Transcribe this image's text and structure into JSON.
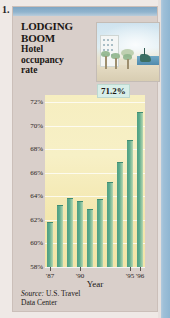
{
  "item_number": "1.",
  "headline": {
    "line1": "LODGING",
    "line2": "BOOM",
    "sub1": "Hotel",
    "sub2": "occupancy",
    "sub3": "rate"
  },
  "illustration_name": "beach-hotel-illustration",
  "callout": "71.2%",
  "source": {
    "label": "Source:",
    "text": " U.S. Travel",
    "line2": "Data Center"
  },
  "chart_data": {
    "type": "bar",
    "title": "Hotel occupancy rate",
    "xlabel": "Year",
    "ylabel": "",
    "ylim": [
      58,
      72.6
    ],
    "grid": true,
    "ytick_values": [
      72,
      70,
      68,
      66,
      64,
      62,
      60,
      58
    ],
    "ytick_labels": [
      "72%",
      "70%",
      "68%",
      "66%",
      "64%",
      "62%",
      "60%",
      "58%"
    ],
    "categories": [
      "'87",
      "'88",
      "'89",
      "'90",
      "'91",
      "'92",
      "'93",
      "'94",
      "'95",
      "'96"
    ],
    "xtick_labels": [
      "'87",
      "'90",
      "'95",
      "'96"
    ],
    "xtick_indices": [
      0,
      3,
      8,
      9
    ],
    "values": [
      61.8,
      63.3,
      63.9,
      63.6,
      62.9,
      63.8,
      65.2,
      66.9,
      68.8,
      71.2
    ],
    "annotations": [
      {
        "label": "71.2%",
        "category": "'96",
        "value": 71.2
      }
    ],
    "bar_color": "#5dab8c",
    "plot_background": "#f4eab8"
  },
  "colors": {
    "panel_background": "#d9cfca",
    "top_band": "#8fb3cd",
    "accent_stripe": "#9fc0d8",
    "callout_background": "#d8eee8"
  }
}
